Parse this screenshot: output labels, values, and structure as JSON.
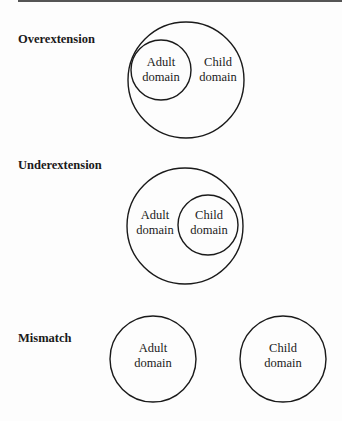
{
  "sections": [
    {
      "label": "Overextension",
      "circles": [
        {
          "role": "child",
          "text": [
            "Child",
            "domain"
          ]
        },
        {
          "role": "adult",
          "text": [
            "Adult",
            "domain"
          ]
        }
      ]
    },
    {
      "label": "Underextension",
      "circles": [
        {
          "role": "adult",
          "text": [
            "Adult",
            "domain"
          ]
        },
        {
          "role": "child",
          "text": [
            "Child",
            "domain"
          ]
        }
      ]
    },
    {
      "label": "Mismatch",
      "circles": [
        {
          "role": "adult",
          "text": [
            "Adult",
            "domain"
          ]
        },
        {
          "role": "child",
          "text": [
            "Child",
            "domain"
          ]
        }
      ]
    }
  ],
  "colors": {
    "stroke": "#1a1a1a",
    "background": "#fdfdfd",
    "rule": "#555555"
  }
}
